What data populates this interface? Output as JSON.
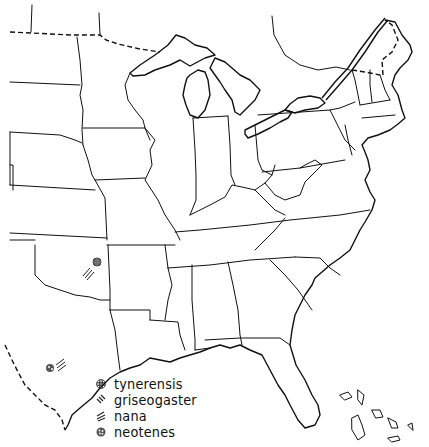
{
  "map": {
    "title": "",
    "region": "Eastern United States",
    "line_color": "#111111",
    "background": "#ffffff"
  },
  "legend": {
    "items": [
      {
        "label": "tynerensis",
        "symbol": "crosshatch-dot-icon"
      },
      {
        "label": "griseogaster",
        "symbol": "diagonal-lines-icon"
      },
      {
        "label": "nana",
        "symbol": "double-slash-icon"
      },
      {
        "label": "neotenes",
        "symbol": "stipple-dot-icon"
      }
    ]
  },
  "localities": [
    {
      "species": "tynerensis",
      "location": "northeastern Oklahoma",
      "x": 97,
      "y": 262
    },
    {
      "species": "griseogaster",
      "location": "northeastern Oklahoma",
      "x": 88,
      "y": 273
    },
    {
      "species": "neotenes",
      "location": "south-central Texas",
      "x": 50,
      "y": 368
    },
    {
      "species": "nana",
      "location": "south-central Texas",
      "x": 60,
      "y": 362
    }
  ]
}
